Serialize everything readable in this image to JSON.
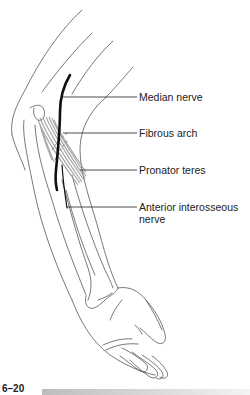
{
  "figure": {
    "number": "6–20",
    "labels": [
      {
        "id": "median-nerve",
        "text": "Median nerve"
      },
      {
        "id": "fibrous-arch",
        "text": "Fibrous arch"
      },
      {
        "id": "pronator-teres",
        "text": "Pronator teres"
      },
      {
        "id": "anterior-interosseous-nerve",
        "line1": "Anterior interosseous",
        "line2": "nerve"
      }
    ]
  },
  "colors": {
    "line": "#555555",
    "nerve": "#111111",
    "muscle": "#a8a8a8",
    "text": "#222222",
    "caption_bar": "#c8c8c8"
  }
}
